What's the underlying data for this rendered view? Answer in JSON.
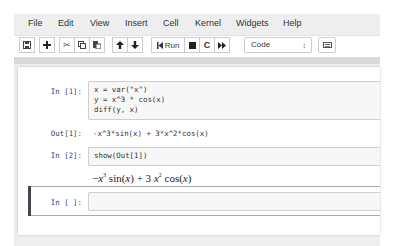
{
  "menubar": {
    "items": [
      "File",
      "Edit",
      "View",
      "Insert",
      "Cell",
      "Kernel",
      "Widgets",
      "Help"
    ]
  },
  "toolbar": {
    "buttons": [
      {
        "name": "save",
        "icon": "floppy-disk-icon"
      },
      {
        "name": "insert-cell-below",
        "icon": "plus-icon"
      },
      {
        "name": "cut",
        "icon": "scissors-icon"
      },
      {
        "name": "copy",
        "icon": "copy-icon"
      },
      {
        "name": "paste",
        "icon": "paste-icon"
      },
      {
        "name": "move-up",
        "icon": "arrow-up-icon"
      },
      {
        "name": "move-down",
        "icon": "arrow-down-icon"
      },
      {
        "name": "run",
        "icon": "step-forward-icon",
        "label": "Run"
      },
      {
        "name": "interrupt",
        "icon": "stop-icon"
      },
      {
        "name": "restart",
        "icon": "refresh-icon"
      },
      {
        "name": "restart-run-all",
        "icon": "fast-forward-icon"
      },
      {
        "name": "command-palette",
        "icon": "keyboard-icon"
      }
    ],
    "run_label": "Run",
    "cell_type": "Code",
    "cell_type_arrow": "↕"
  },
  "cells": [
    {
      "prompt": "In [1]:",
      "code": [
        "x = var(\"x\")",
        "y = x^3 * cos(x)",
        "diff(y, x)"
      ],
      "output_prompt": "Out[1]:",
      "output": "-x^3*sin(x) + 3*x^2*cos(x)"
    },
    {
      "prompt": "In [2]:",
      "code": [
        "show(Out[1])"
      ],
      "math_output": {
        "parts": [
          "−",
          "x",
          "3",
          " sin(",
          "x",
          ") + 3 ",
          "x",
          "2",
          " cos(",
          "x",
          ")"
        ]
      }
    },
    {
      "prompt": "In [ ]:",
      "code": [
        ""
      ],
      "selected": true
    }
  ],
  "colors": {
    "prompt_in": "#303f9f",
    "selected_bar": "#42484d",
    "input_bg": "#f7f7f7",
    "menubar_bg": "#eeeeee"
  }
}
